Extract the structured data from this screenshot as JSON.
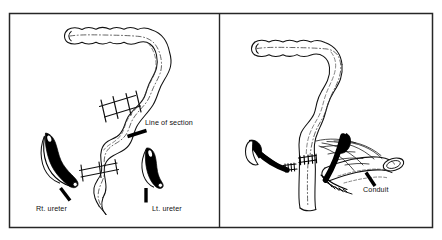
{
  "figure": {
    "type": "medical-line-illustration",
    "background_color": "#ffffff",
    "ink_color": "#000000",
    "frame": {
      "stroke": "#222222",
      "x": 9,
      "y": 13,
      "width": 424,
      "height": 215,
      "divider_x": 219
    },
    "panels": [
      {
        "id": "panel-left",
        "name": "left-panel",
        "caption": "Isolation of colon segment and identification of ureters",
        "labels": [
          {
            "id": "line-of-section",
            "text": "Line of section",
            "x": 145,
            "y": 125
          },
          {
            "id": "rt-ureter",
            "text": "Rt. ureter",
            "x": 36,
            "y": 211
          },
          {
            "id": "lt-ureter",
            "text": "Lt. ureter",
            "x": 152,
            "y": 211
          }
        ],
        "structures": [
          "transverse-colon",
          "descending-colon",
          "sigmoid-colon",
          "right-ureter",
          "left-ureter",
          "proximal-section-line",
          "distal-section-line"
        ]
      },
      {
        "id": "panel-right",
        "name": "right-panel",
        "caption": "Completed conduit with ureters implanted and colon re-anastomosed",
        "labels": [
          {
            "id": "conduit",
            "text": "Conduit",
            "x": 363,
            "y": 192
          }
        ],
        "structures": [
          "transverse-colon",
          "descending-colon",
          "colo-colonic-anastomosis",
          "right-ureter",
          "left-ureter",
          "conduit-segment",
          "mesentery",
          "stoma"
        ]
      }
    ]
  }
}
